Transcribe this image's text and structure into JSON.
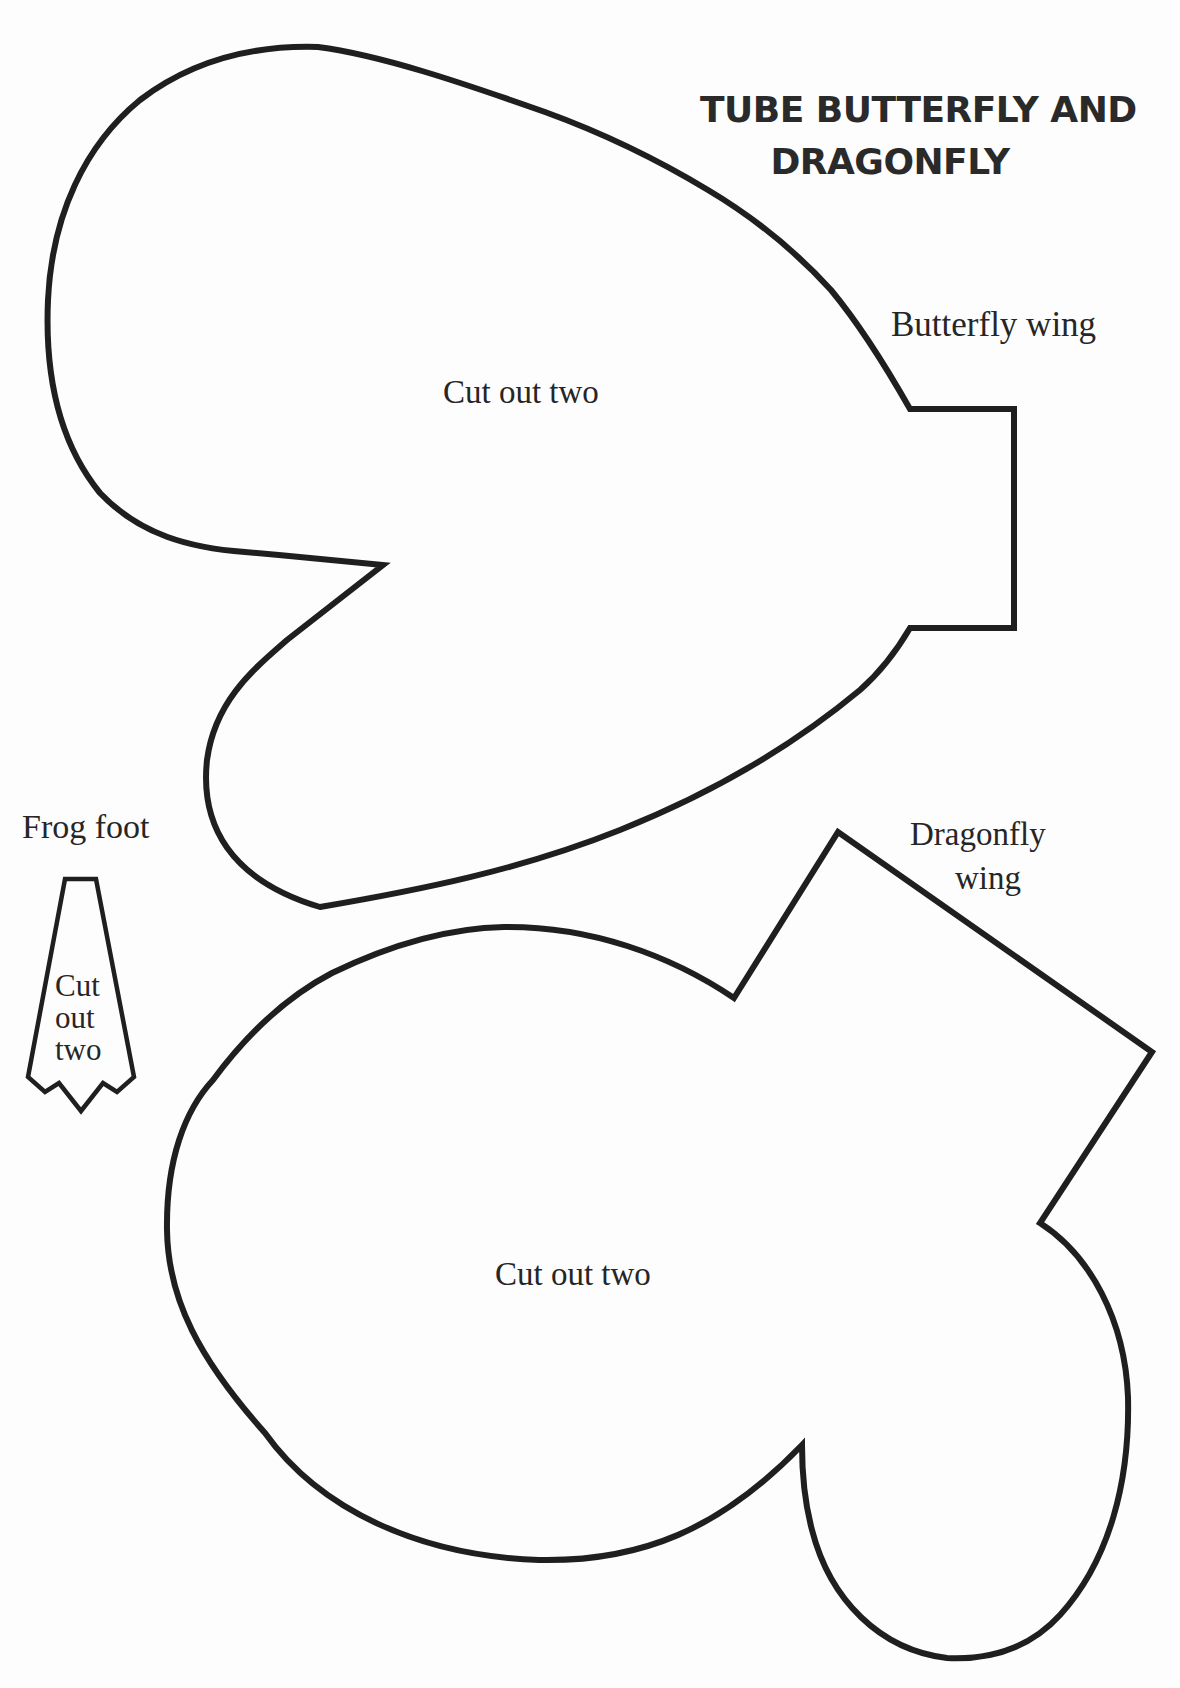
{
  "document": {
    "title_line1": "TUBE BUTTERFLY AND",
    "title_line2": "DRAGONFLY",
    "ink_color": "#1f1f1f",
    "paper_color": "#fdfdfd"
  },
  "templates": {
    "butterfly_wing": {
      "label": "Butterfly wing",
      "instruction": "Cut out two"
    },
    "dragonfly_wing": {
      "label_line1": "Dragonfly",
      "label_line2": "wing",
      "instruction": "Cut out two"
    },
    "frog_foot": {
      "label": "Frog foot",
      "instruction_line1": "Cut",
      "instruction_line2": "out",
      "instruction_line3": "two"
    }
  }
}
